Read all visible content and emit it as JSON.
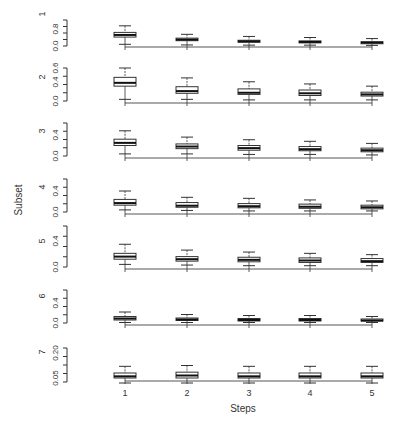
{
  "chart_data": {
    "type": "boxplot",
    "title": "",
    "xlabel": "Steps",
    "ylabel": "Subset",
    "categories": [
      "1",
      "2",
      "3",
      "4",
      "5"
    ],
    "grid": false,
    "legend": null,
    "panels": [
      {
        "label": "1",
        "ylim": [
          0.0,
          1.0
        ],
        "y_ticks": [
          "0.0",
          "0.8"
        ],
        "boxes": [
          {
            "step": "1",
            "whisker_low": 0.08,
            "q1": 0.42,
            "median": 0.52,
            "q3": 0.64,
            "whisker_high": 0.95
          },
          {
            "step": "2",
            "whisker_low": 0.05,
            "q1": 0.25,
            "median": 0.3,
            "q3": 0.37,
            "whisker_high": 0.55
          },
          {
            "step": "3",
            "whisker_low": 0.04,
            "q1": 0.18,
            "median": 0.22,
            "q3": 0.27,
            "whisker_high": 0.45
          },
          {
            "step": "4",
            "whisker_low": 0.04,
            "q1": 0.15,
            "median": 0.19,
            "q3": 0.24,
            "whisker_high": 0.4
          },
          {
            "step": "5",
            "whisker_low": 0.03,
            "q1": 0.13,
            "median": 0.16,
            "q3": 0.2,
            "whisker_high": 0.35
          }
        ]
      },
      {
        "label": "2",
        "ylim": [
          0.0,
          0.6
        ],
        "y_ticks": [
          "0.0",
          "0.4",
          "0.6"
        ],
        "boxes": [
          {
            "step": "1",
            "whisker_low": 0.03,
            "q1": 0.27,
            "median": 0.33,
            "q3": 0.43,
            "whisker_high": 0.6
          },
          {
            "step": "2",
            "whisker_low": 0.03,
            "q1": 0.14,
            "median": 0.18,
            "q3": 0.26,
            "whisker_high": 0.42
          },
          {
            "step": "3",
            "whisker_low": 0.02,
            "q1": 0.12,
            "median": 0.15,
            "q3": 0.22,
            "whisker_high": 0.35
          },
          {
            "step": "4",
            "whisker_low": 0.02,
            "q1": 0.1,
            "median": 0.14,
            "q3": 0.2,
            "whisker_high": 0.31
          },
          {
            "step": "5",
            "whisker_low": 0.02,
            "q1": 0.09,
            "median": 0.12,
            "q3": 0.16,
            "whisker_high": 0.27
          }
        ]
      },
      {
        "label": "3",
        "ylim": [
          0.0,
          0.6
        ],
        "y_ticks": [
          "0.0",
          "0.4"
        ],
        "boxes": [
          {
            "step": "1",
            "whisker_low": 0.04,
            "q1": 0.2,
            "median": 0.25,
            "q3": 0.32,
            "whisker_high": 0.48
          },
          {
            "step": "2",
            "whisker_low": 0.04,
            "q1": 0.14,
            "median": 0.18,
            "q3": 0.23,
            "whisker_high": 0.36
          },
          {
            "step": "3",
            "whisker_low": 0.03,
            "q1": 0.11,
            "median": 0.15,
            "q3": 0.2,
            "whisker_high": 0.31
          },
          {
            "step": "4",
            "whisker_low": 0.03,
            "q1": 0.1,
            "median": 0.13,
            "q3": 0.18,
            "whisker_high": 0.28
          },
          {
            "step": "5",
            "whisker_low": 0.02,
            "q1": 0.08,
            "median": 0.11,
            "q3": 0.15,
            "whisker_high": 0.24
          }
        ]
      },
      {
        "label": "4",
        "ylim": [
          0.0,
          0.6
        ],
        "y_ticks": [
          "0.0",
          "0.4"
        ],
        "boxes": [
          {
            "step": "1",
            "whisker_low": 0.04,
            "q1": 0.13,
            "median": 0.17,
            "q3": 0.24,
            "whisker_high": 0.4
          },
          {
            "step": "2",
            "whisker_low": 0.03,
            "q1": 0.09,
            "median": 0.12,
            "q3": 0.18,
            "whisker_high": 0.28
          },
          {
            "step": "3",
            "whisker_low": 0.02,
            "q1": 0.08,
            "median": 0.11,
            "q3": 0.16,
            "whisker_high": 0.26
          },
          {
            "step": "4",
            "whisker_low": 0.02,
            "q1": 0.07,
            "median": 0.1,
            "q3": 0.15,
            "whisker_high": 0.23
          },
          {
            "step": "5",
            "whisker_low": 0.02,
            "q1": 0.06,
            "median": 0.09,
            "q3": 0.13,
            "whisker_high": 0.21
          }
        ]
      },
      {
        "label": "5",
        "ylim": [
          0.0,
          0.4
        ],
        "y_ticks": [
          "0.0",
          "0.4"
        ],
        "boxes": [
          {
            "step": "1",
            "whisker_low": 0.04,
            "q1": 0.12,
            "median": 0.16,
            "q3": 0.21,
            "whisker_high": 0.35
          },
          {
            "step": "2",
            "whisker_low": 0.03,
            "q1": 0.09,
            "median": 0.12,
            "q3": 0.16,
            "whisker_high": 0.26
          },
          {
            "step": "3",
            "whisker_low": 0.02,
            "q1": 0.08,
            "median": 0.11,
            "q3": 0.15,
            "whisker_high": 0.23
          },
          {
            "step": "4",
            "whisker_low": 0.02,
            "q1": 0.07,
            "median": 0.1,
            "q3": 0.14,
            "whisker_high": 0.21
          },
          {
            "step": "5",
            "whisker_low": 0.02,
            "q1": 0.07,
            "median": 0.09,
            "q3": 0.13,
            "whisker_high": 0.19
          }
        ]
      },
      {
        "label": "6",
        "ylim": [
          0.0,
          0.6
        ],
        "y_ticks": [
          "0.0",
          "0.4"
        ],
        "boxes": [
          {
            "step": "1",
            "whisker_low": 0.01,
            "q1": 0.06,
            "median": 0.09,
            "q3": 0.13,
            "whisker_high": 0.22
          },
          {
            "step": "2",
            "whisker_low": 0.01,
            "q1": 0.05,
            "median": 0.07,
            "q3": 0.1,
            "whisker_high": 0.17
          },
          {
            "step": "3",
            "whisker_low": 0.01,
            "q1": 0.04,
            "median": 0.06,
            "q3": 0.09,
            "whisker_high": 0.15
          },
          {
            "step": "4",
            "whisker_low": 0.01,
            "q1": 0.04,
            "median": 0.06,
            "q3": 0.09,
            "whisker_high": 0.15
          },
          {
            "step": "5",
            "whisker_low": 0.01,
            "q1": 0.04,
            "median": 0.05,
            "q3": 0.08,
            "whisker_high": 0.13
          }
        ]
      },
      {
        "label": "7",
        "ylim": [
          0.0,
          0.25
        ],
        "y_ticks": [
          "0.05",
          "0.20"
        ],
        "boxes": [
          {
            "step": "1",
            "whisker_low": 0.02,
            "q1": 0.05,
            "median": 0.06,
            "q3": 0.08,
            "whisker_high": 0.12
          },
          {
            "step": "2",
            "whisker_low": 0.02,
            "q1": 0.05,
            "median": 0.065,
            "q3": 0.085,
            "whisker_high": 0.125
          },
          {
            "step": "3",
            "whisker_low": 0.02,
            "q1": 0.05,
            "median": 0.06,
            "q3": 0.08,
            "whisker_high": 0.12
          },
          {
            "step": "4",
            "whisker_low": 0.02,
            "q1": 0.05,
            "median": 0.06,
            "q3": 0.08,
            "whisker_high": 0.12
          },
          {
            "step": "5",
            "whisker_low": 0.02,
            "q1": 0.05,
            "median": 0.06,
            "q3": 0.08,
            "whisker_high": 0.12
          }
        ]
      }
    ]
  },
  "layout": {
    "x_positions": [
      125,
      187,
      249,
      310,
      372
    ],
    "box_half_width": 11,
    "cap_half_width": 6,
    "y_axis_x": 67,
    "panels_px": [
      {
        "top": 20,
        "bottom": 46,
        "axis_y": 47,
        "label_y": 14,
        "tick_px": [
          46,
          29
        ]
      },
      {
        "top": 68,
        "bottom": 101,
        "axis_y": 103,
        "label_y": 77,
        "tick_px": [
          101,
          82,
          68
        ]
      },
      {
        "top": 123,
        "bottom": 156,
        "axis_y": 158,
        "label_y": 131,
        "tick_px": [
          156,
          135
        ]
      },
      {
        "top": 179,
        "bottom": 212,
        "axis_y": 214,
        "label_y": 187,
        "tick_px": [
          212,
          191
        ]
      },
      {
        "top": 226,
        "bottom": 267,
        "axis_y": 269,
        "label_y": 241,
        "tick_px": [
          267,
          241
        ]
      },
      {
        "top": 290,
        "bottom": 323,
        "axis_y": 325,
        "label_y": 296,
        "tick_px": [
          323,
          303
        ]
      },
      {
        "top": 348,
        "bottom": 382,
        "axis_y": 381,
        "label_y": 352,
        "tick_px": [
          378,
          353
        ]
      }
    ],
    "x_label_y": 396,
    "x_title_pos": [
      243,
      412
    ],
    "y_title_pos": [
      22,
      200
    ]
  },
  "labels": {
    "x_axis_title": "Steps",
    "y_axis_title": "Subset"
  }
}
